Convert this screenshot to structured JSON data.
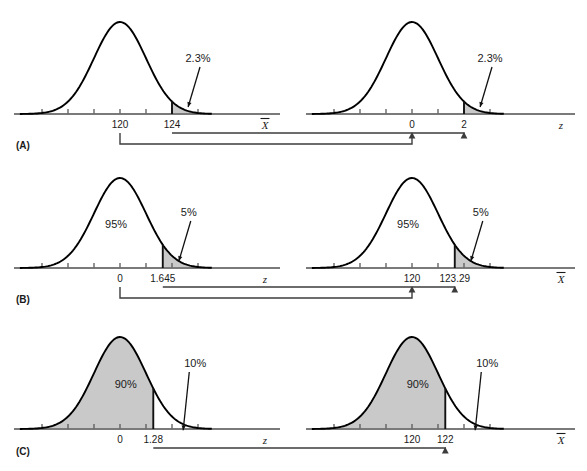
{
  "figure": {
    "background_color": "#ffffff",
    "curve_color": "#000000",
    "shade_color": "#c9c9c9",
    "axis_color": "#7a7a7a",
    "connector_color": "#3c3c3c",
    "text_color": "#1a1a1a"
  },
  "panels": [
    {
      "id": "A",
      "label": "(A)",
      "left": {
        "name": "xbar-distribution-a",
        "axis_label": "X̄",
        "axis_label_base": "X",
        "center_label": "120",
        "cut_label": "124",
        "tail_pct": "2.3%",
        "body_pct": "",
        "shade_side": "right",
        "center_z": 0,
        "cut_z": 2
      },
      "right": {
        "name": "z-distribution-a",
        "axis_label": "z",
        "axis_label_base": "z",
        "center_label": "0",
        "cut_label": "2",
        "tail_pct": "2.3%",
        "body_pct": "",
        "shade_side": "right",
        "center_z": 0,
        "cut_z": 2
      },
      "connectors": [
        {
          "from": "center",
          "to": "center",
          "name": "connector-120-to-0"
        },
        {
          "from": "cut",
          "to": "cut",
          "name": "connector-124-to-2"
        }
      ]
    },
    {
      "id": "B",
      "label": "(B)",
      "left": {
        "name": "z-distribution-b",
        "axis_label": "z",
        "axis_label_base": "z",
        "center_label": "0",
        "cut_label": "1.645",
        "tail_pct": "5%",
        "body_pct": "95%",
        "shade_side": "right",
        "center_z": 0,
        "cut_z": 1.645
      },
      "right": {
        "name": "xbar-distribution-b",
        "axis_label": "X̄",
        "axis_label_base": "X",
        "center_label": "120",
        "cut_label": "123.29",
        "tail_pct": "5%",
        "body_pct": "95%",
        "shade_side": "right",
        "center_z": 0,
        "cut_z": 1.645
      },
      "connectors": [
        {
          "from": "center",
          "to": "center",
          "name": "connector-0-to-120"
        },
        {
          "from": "cut",
          "to": "cut",
          "name": "connector-1645-to-12329"
        }
      ]
    },
    {
      "id": "C",
      "label": "(C)",
      "left": {
        "name": "z-distribution-c",
        "axis_label": "z",
        "axis_label_base": "z",
        "center_label": "0",
        "cut_label": "1.28",
        "tail_pct": "10%",
        "body_pct": "90%",
        "shade_side": "left",
        "center_z": 0,
        "cut_z": 1.28
      },
      "right": {
        "name": "xbar-distribution-c",
        "axis_label": "X̄",
        "axis_label_base": "X",
        "center_label": "120",
        "cut_label": "122",
        "tail_pct": "10%",
        "body_pct": "90%",
        "shade_side": "left",
        "center_z": 0,
        "cut_z": 1.28
      },
      "connectors": [
        {
          "from": "cut",
          "to": "cut",
          "name": "connector-128-to-122"
        }
      ]
    }
  ],
  "chart_data": {
    "type": "line",
    "title": "",
    "curve": "standard normal density",
    "xlim_sigma": [
      -3.6,
      3.6
    ],
    "grid": false,
    "legend": null,
    "series": [
      {
        "name": "A-left (X-bar)",
        "axis": "X̄",
        "mean_label": "120",
        "cut_label": "124",
        "cut_sigma": 2,
        "shaded_region": "right tail",
        "shaded_pct": 2.3,
        "annotations": [
          "2.3%"
        ],
        "tick_labels": [
          "120",
          "124"
        ]
      },
      {
        "name": "A-right (z)",
        "axis": "z",
        "mean_label": "0",
        "cut_label": "2",
        "cut_sigma": 2,
        "shaded_region": "right tail",
        "shaded_pct": 2.3,
        "annotations": [
          "2.3%"
        ],
        "tick_labels": [
          "0",
          "2"
        ]
      },
      {
        "name": "B-left (z)",
        "axis": "z",
        "mean_label": "0",
        "cut_label": "1.645",
        "cut_sigma": 1.645,
        "shaded_region": "right tail",
        "shaded_pct": 5,
        "body_pct": 95,
        "annotations": [
          "95%",
          "5%"
        ],
        "tick_labels": [
          "0",
          "1.645"
        ]
      },
      {
        "name": "B-right (X-bar)",
        "axis": "X̄",
        "mean_label": "120",
        "cut_label": "123.29",
        "cut_sigma": 1.645,
        "shaded_region": "right tail",
        "shaded_pct": 5,
        "body_pct": 95,
        "annotations": [
          "95%",
          "5%"
        ],
        "tick_labels": [
          "120",
          "123.29"
        ]
      },
      {
        "name": "C-left (z)",
        "axis": "z",
        "mean_label": "0",
        "cut_label": "1.28",
        "cut_sigma": 1.28,
        "shaded_region": "left body",
        "shaded_pct": 90,
        "tail_pct": 10,
        "annotations": [
          "90%",
          "10%"
        ],
        "tick_labels": [
          "0",
          "1.28"
        ]
      },
      {
        "name": "C-right (X-bar)",
        "axis": "X̄",
        "mean_label": "120",
        "cut_label": "122",
        "cut_sigma": 1.28,
        "shaded_region": "left body",
        "shaded_pct": 90,
        "tail_pct": 10,
        "annotations": [
          "90%",
          "10%"
        ],
        "tick_labels": [
          "120",
          "122"
        ]
      }
    ]
  }
}
